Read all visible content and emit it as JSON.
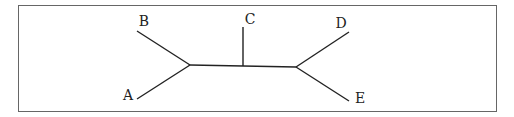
{
  "diagram": {
    "type": "unrooted-tree",
    "labels": {
      "A": "A",
      "B": "B",
      "C": "C",
      "D": "D",
      "E": "E"
    },
    "edges": [
      {
        "from": "B",
        "to": "left-internal"
      },
      {
        "from": "A",
        "to": "left-internal"
      },
      {
        "from": "left-internal",
        "to": "right-internal"
      },
      {
        "from": "C",
        "to": "middle-junction"
      },
      {
        "from": "D",
        "to": "right-internal"
      },
      {
        "from": "E",
        "to": "right-internal"
      }
    ],
    "colors": {
      "line": "#222222",
      "border": "#555555",
      "background": "#ffffff"
    }
  }
}
